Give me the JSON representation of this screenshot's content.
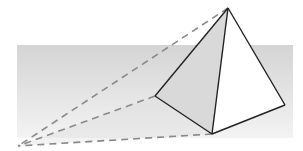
{
  "diagram": {
    "canvas": {
      "width": 303,
      "height": 151,
      "background": "#ffffff"
    },
    "colors": {
      "band_top": "#d4d4d4",
      "band_bottom": "#f3f3f3",
      "shadow_face": "#d9d9d9",
      "light_face": "#ffffff",
      "edge": "#222222",
      "dashed": "#8a8a8a"
    },
    "horizon_band": {
      "x": 17,
      "y": 45,
      "width": 276,
      "height": 93
    },
    "vanishing_point": {
      "x": 18,
      "y": 146
    },
    "vertices": {
      "apex": {
        "x": 228,
        "y": 8
      },
      "base_left": {
        "x": 155,
        "y": 96
      },
      "base_front": {
        "x": 212,
        "y": 134
      },
      "base_right": {
        "x": 285,
        "y": 105
      }
    },
    "projection_lines": [
      {
        "from": "apex",
        "to": "vanishing_point"
      },
      {
        "from": "base_left",
        "to": "vanishing_point"
      },
      {
        "from": "base_front",
        "to": "vanishing_point"
      }
    ]
  }
}
